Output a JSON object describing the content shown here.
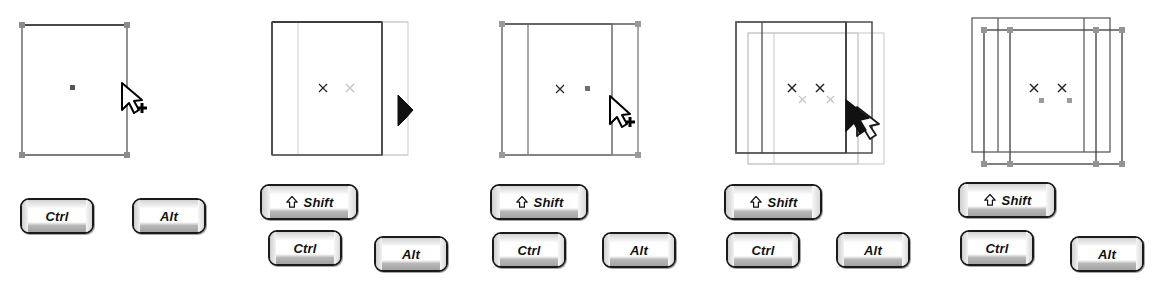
{
  "figure": {
    "panel_count": 5,
    "background_color": "#ffffff",
    "stroke_dark": "#333333",
    "stroke_light": "#c8c8c8",
    "handle_color": "#8c8c8c",
    "marker_dark": "#222222",
    "marker_light": "#bdbdbd"
  },
  "keys": {
    "ctrl_label": "Ctrl",
    "alt_label": "Alt",
    "shift_label": "Shift",
    "shift_icon": "shift-up-arrow-icon"
  },
  "panels": [
    {
      "index": 1,
      "name": "select-object",
      "cursor": "arrow-plus-cursor",
      "shapes": [
        "rectangle-original"
      ],
      "handles_visible": true,
      "markers": [
        {
          "type": "square",
          "tone": "dark"
        }
      ],
      "keys_shown": [
        "Ctrl",
        "Alt"
      ],
      "shift_shown": false
    },
    {
      "index": 2,
      "name": "drag-copy-in-progress",
      "cursor": "solid-arrow-cursor",
      "shapes": [
        "rectangle-original",
        "rectangle-copy-preview"
      ],
      "handles_visible": false,
      "markers": [
        {
          "type": "cross",
          "tone": "dark"
        },
        {
          "type": "cross",
          "tone": "light"
        }
      ],
      "keys_shown": [
        "Ctrl",
        "Alt"
      ],
      "shift_shown": true
    },
    {
      "index": 3,
      "name": "copy-placed-horizontal",
      "cursor": "arrow-plus-cursor",
      "shapes": [
        "rectangle-original",
        "rectangle-copy"
      ],
      "handles_visible": true,
      "markers": [
        {
          "type": "cross",
          "tone": "dark"
        },
        {
          "type": "square",
          "tone": "dark"
        }
      ],
      "keys_shown": [
        "Ctrl",
        "Alt"
      ],
      "shift_shown": true
    },
    {
      "index": 4,
      "name": "drag-copy-diagonal",
      "cursor": "double-arrow-copy-cursor",
      "shapes": [
        "group-original",
        "group-copy-preview"
      ],
      "handles_visible": false,
      "markers": [
        {
          "type": "cross",
          "tone": "dark"
        },
        {
          "type": "cross",
          "tone": "dark"
        },
        {
          "type": "cross",
          "tone": "light"
        },
        {
          "type": "cross",
          "tone": "light"
        }
      ],
      "keys_shown": [
        "Ctrl",
        "Alt"
      ],
      "shift_shown": true
    },
    {
      "index": 5,
      "name": "copy-complete-selected",
      "cursor": "none",
      "shapes": [
        "group-original",
        "group-copy"
      ],
      "handles_visible": true,
      "markers": [
        {
          "type": "cross",
          "tone": "dark"
        },
        {
          "type": "cross",
          "tone": "dark"
        },
        {
          "type": "square",
          "tone": "mid"
        },
        {
          "type": "square",
          "tone": "mid"
        }
      ],
      "keys_shown": [
        "Ctrl",
        "Alt"
      ],
      "shift_shown": true
    }
  ]
}
